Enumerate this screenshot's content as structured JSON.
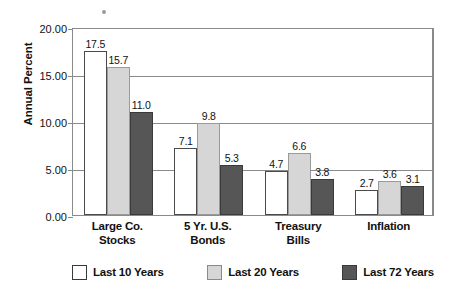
{
  "chart_data": {
    "type": "bar",
    "title": "",
    "subtitle": "",
    "xlabel": "",
    "ylabel": "Annual Percent",
    "ylim": [
      0,
      20
    ],
    "ytick_values": [
      0,
      5,
      10,
      15,
      20
    ],
    "ytick_labels": [
      "0.00",
      "5.00",
      "10.00",
      "15.00",
      "20.00"
    ],
    "grid": true,
    "legend_position": "bottom",
    "categories": [
      "Large Co. Stocks",
      "5 Yr. U.S. Bonds",
      "Treasury Bills",
      "Inflation"
    ],
    "category_lines": [
      [
        "Large Co.",
        "Stocks"
      ],
      [
        "5 Yr. U.S.",
        "Bonds"
      ],
      [
        "Treasury",
        "Bills"
      ],
      [
        "Inflation",
        ""
      ]
    ],
    "series": [
      {
        "name": "Last 10 Years",
        "color": "#ffffff",
        "values": [
          17.5,
          7.1,
          4.7,
          2.7
        ],
        "labels": [
          "17.5",
          "7.1",
          "4.7",
          "2.7"
        ]
      },
      {
        "name": "Last 20 Years",
        "color": "#d6d6d6",
        "values": [
          15.7,
          9.8,
          6.6,
          3.6
        ],
        "labels": [
          "15.7",
          "9.8",
          "6.6",
          "3.6"
        ]
      },
      {
        "name": "Last 72 Years",
        "color": "#565656",
        "values": [
          11.0,
          5.3,
          3.8,
          3.1
        ],
        "labels": [
          "11.0",
          "5.3",
          "3.8",
          "3.1"
        ]
      }
    ]
  },
  "axis": {
    "y_title": "Annual Percent"
  },
  "legend": {
    "items": [
      {
        "label": "Last 10 Years",
        "color": "#ffffff"
      },
      {
        "label": "Last 20 Years",
        "color": "#d6d6d6"
      },
      {
        "label": "Last 72 Years",
        "color": "#565656"
      }
    ]
  },
  "bottom_bleed": {
    "left": "",
    "right": ""
  }
}
